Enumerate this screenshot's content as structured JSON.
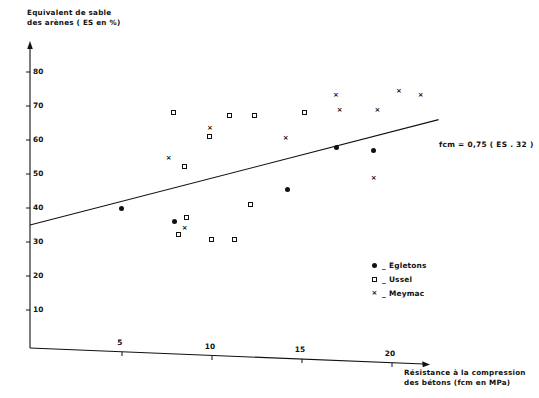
{
  "chart_data": {
    "type": "scatter",
    "title": "",
    "xlabel": "Résistance à la compression des bétons (fcm en MPa)",
    "ylabel": "Equivalent de sable des arènes (ES en %)",
    "xlim": [
      0,
      23.5
    ],
    "ylim": [
      0,
      89
    ],
    "grid": false,
    "legend_position": "inside-bottom-right",
    "xticks": [
      5,
      10,
      15,
      20
    ],
    "yticks": [
      10,
      20,
      30,
      40,
      50,
      60,
      70,
      80
    ],
    "annotation": "fcm = 0,75 ( ES . 32 )",
    "trendline": {
      "label": "fcm = 0,75 ( ES . 32 )",
      "x": [
        0,
        22.7
      ],
      "y": [
        35,
        66
      ]
    },
    "series": [
      {
        "name": "Egletons",
        "marker": "filled-circle",
        "color": "#111111",
        "points": [
          {
            "x": 5.1,
            "y": 39.8
          },
          {
            "x": 8.0,
            "y": 36.0
          },
          {
            "x": 14.3,
            "y": 45.4
          },
          {
            "x": 17.0,
            "y": 57.8
          },
          {
            "x": 19.1,
            "y": 57.0
          }
        ]
      },
      {
        "name": "Ussel",
        "marker": "open-square",
        "color": "#111111",
        "points": [
          {
            "x": 8.0,
            "y": 67.8
          },
          {
            "x": 8.3,
            "y": 32.2
          },
          {
            "x": 8.6,
            "y": 52.2
          },
          {
            "x": 8.7,
            "y": 37.0
          },
          {
            "x": 10.0,
            "y": 61.0
          },
          {
            "x": 10.1,
            "y": 30.6
          },
          {
            "x": 11.1,
            "y": 67.0
          },
          {
            "x": 11.4,
            "y": 30.6
          },
          {
            "x": 12.3,
            "y": 40.8
          },
          {
            "x": 12.5,
            "y": 67.0
          },
          {
            "x": 15.3,
            "y": 67.8
          }
        ]
      },
      {
        "name": "Meymac",
        "marker": "cross",
        "color": "#111111",
        "points": [
          {
            "x": 7.7,
            "y": 54.6
          },
          {
            "x": 8.6,
            "y": 34.0
          },
          {
            "x": 10.0,
            "y": 63.4
          },
          {
            "x": 14.2,
            "y": 60.4
          },
          {
            "x": 17.0,
            "y": 73.0
          },
          {
            "x": 17.2,
            "y": 68.6
          },
          {
            "x": 19.1,
            "y": 48.6
          },
          {
            "x": 19.3,
            "y": 68.6
          },
          {
            "x": 20.5,
            "y": 74.4
          },
          {
            "x": 21.7,
            "y": 73.0
          }
        ]
      }
    ]
  },
  "legend": {
    "dash": "_",
    "items": [
      {
        "label": "Egletons",
        "marker": "filled-circle"
      },
      {
        "label": "Ussel",
        "marker": "open-square"
      },
      {
        "label": "Meymac",
        "marker": "cross"
      }
    ]
  },
  "axis_labels": {
    "y_line1": "Equivalent de sable",
    "y_line2": "des arènes ( ES en %)",
    "x_line1": "Résistance à la compression",
    "x_line2": "des bétons (fcm en MPa)"
  },
  "marker_glyphs": {
    "cross": "×"
  }
}
